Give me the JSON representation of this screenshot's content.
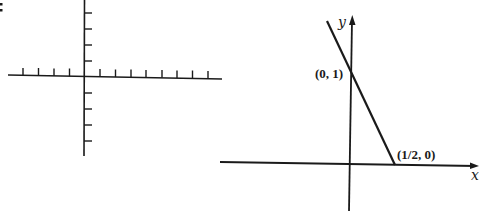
{
  "figure": {
    "prefix_mark": ":",
    "blank_grid": {
      "description": "blank coordinate axes with tick marks",
      "x_ticks_left": 4,
      "x_ticks_right": 8,
      "y_ticks_up": 4,
      "y_ticks_down": 4
    },
    "graph": {
      "x_axis_label": "x",
      "y_axis_label": "y",
      "y_intercept_label": "(0, 1)",
      "x_intercept_label": "(1/2, 0)",
      "line_equation_points": [
        [
          0,
          1
        ],
        [
          0.5,
          0
        ]
      ]
    },
    "colors": {
      "ink": "#1a1a1a",
      "background": "#ffffff"
    }
  }
}
